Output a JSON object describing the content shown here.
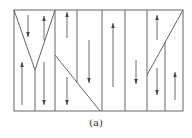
{
  "caption": "(a)",
  "colors": {
    "line": "#666666",
    "arrow": "#444444"
  },
  "frame": {
    "x1": 14,
    "y1": 10,
    "x2": 183,
    "y2": 111
  },
  "lines": [
    {
      "x1": 14,
      "y1": 10,
      "x2": 35,
      "y2": 70
    },
    {
      "x1": 55,
      "y1": 10,
      "x2": 35,
      "y2": 70
    },
    {
      "x1": 35,
      "y1": 70,
      "x2": 35,
      "y2": 111
    },
    {
      "x1": 55,
      "y1": 10,
      "x2": 55,
      "y2": 111
    },
    {
      "x1": 55,
      "y1": 55,
      "x2": 100,
      "y2": 111
    },
    {
      "x1": 77,
      "y1": 10,
      "x2": 77,
      "y2": 83
    },
    {
      "x1": 102,
      "y1": 10,
      "x2": 102,
      "y2": 111
    },
    {
      "x1": 125,
      "y1": 10,
      "x2": 125,
      "y2": 111
    },
    {
      "x1": 147,
      "y1": 10,
      "x2": 147,
      "y2": 111
    },
    {
      "x1": 183,
      "y1": 10,
      "x2": 147,
      "y2": 75
    },
    {
      "x1": 165,
      "y1": 42,
      "x2": 165,
      "y2": 111
    }
  ],
  "arrows": [
    {
      "x": 28,
      "y1": 15,
      "y2": 37,
      "dir": "down"
    },
    {
      "x": 44,
      "y1": 16,
      "y2": 40,
      "dir": "up"
    },
    {
      "x": 22,
      "y1": 62,
      "y2": 105,
      "dir": "up"
    },
    {
      "x": 44,
      "y1": 62,
      "y2": 105,
      "dir": "down"
    },
    {
      "x": 67,
      "y1": 12,
      "y2": 38,
      "dir": "up"
    },
    {
      "x": 67,
      "y1": 77,
      "y2": 105,
      "dir": "down"
    },
    {
      "x": 89,
      "y1": 24,
      "y2": 85,
      "dir": "none"
    },
    {
      "x": 89,
      "y1": 40,
      "y2": 83,
      "dir": "down"
    },
    {
      "x": 113,
      "y1": 23,
      "y2": 87,
      "dir": "up"
    },
    {
      "x": 136,
      "y1": 22,
      "y2": 80,
      "dir": "none"
    },
    {
      "x": 136,
      "y1": 60,
      "y2": 84,
      "dir": "down"
    },
    {
      "x": 157,
      "y1": 15,
      "y2": 40,
      "dir": "up"
    },
    {
      "x": 157,
      "y1": 68,
      "y2": 95,
      "dir": "down"
    },
    {
      "x": 175,
      "y1": 72,
      "y2": 100,
      "dir": "up"
    }
  ]
}
